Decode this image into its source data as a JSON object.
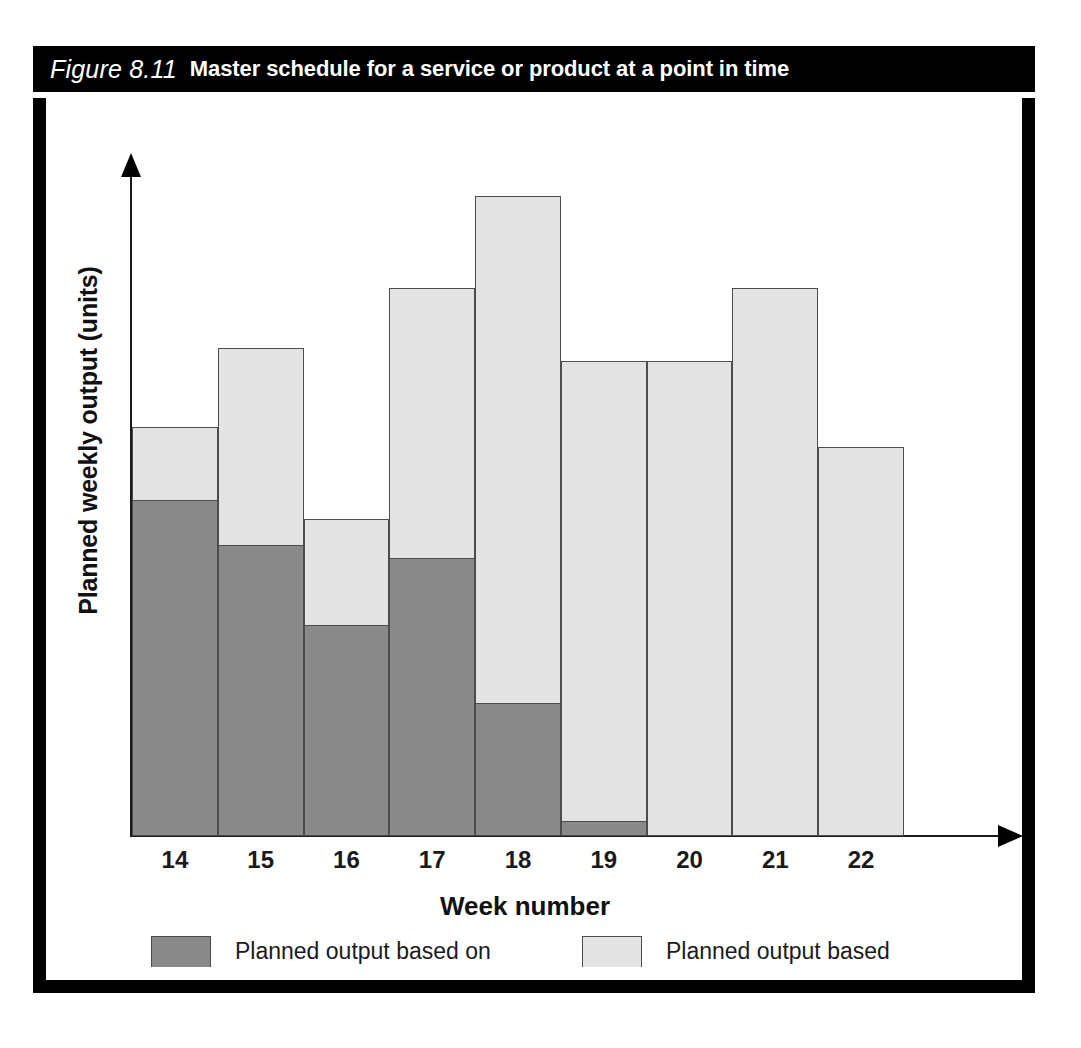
{
  "figure": {
    "number_label": "Figure 8.11",
    "title": "Master schedule for a service or product at a point in time"
  },
  "chart_data": {
    "type": "bar",
    "subtype": "stacked",
    "title": "Master schedule for a service or product at a point in time",
    "xlabel": "Week number",
    "ylabel": "Planned weekly output (units)",
    "categories": [
      "14",
      "15",
      "16",
      "17",
      "18",
      "19",
      "20",
      "21",
      "22"
    ],
    "grid": false,
    "legend_position": "bottom",
    "axis_ticks_labeled": false,
    "ylim": [
      0,
      100
    ],
    "series": [
      {
        "name": "Planned output based on known customer orders",
        "color": "#8a8a8a",
        "values": [
          51,
          44,
          32,
          42,
          20,
          2,
          0,
          0,
          0
        ]
      },
      {
        "name": "Planned output based on sales forecasts",
        "color": "#e3e3e3",
        "values": [
          11,
          30,
          16,
          41,
          77,
          70,
          72,
          83,
          59
        ]
      }
    ],
    "totals": [
      62,
      74,
      48,
      83,
      97,
      72,
      72,
      83,
      59
    ]
  },
  "axes": {
    "x_title": "Week number",
    "y_title": "Planned weekly output (units)",
    "x_tick_labels": [
      "14",
      "15",
      "16",
      "17",
      "18",
      "19",
      "20",
      "21",
      "22"
    ]
  },
  "legend": {
    "items": [
      {
        "label": "Planned output based on\nknown customer orders",
        "color": "#8a8a8a"
      },
      {
        "label": "Planned output based\non sales forecasts",
        "color": "#e3e3e3"
      }
    ]
  },
  "colors": {
    "frame": "#000000",
    "title_bar_bg": "#000000",
    "title_bar_fg": "#ffffff",
    "known_orders": "#8a8a8a",
    "sales_forecast": "#e3e3e3",
    "bar_outline": "#4d4d4d",
    "axis": "#1a1a1a",
    "page_bg": "#ffffff"
  }
}
